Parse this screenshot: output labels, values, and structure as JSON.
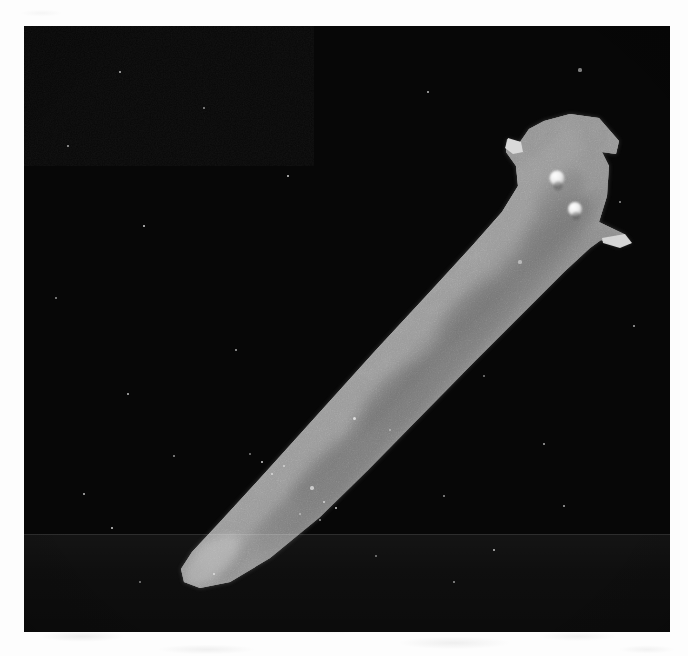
{
  "document": {
    "type": "photomicrograph",
    "medium": "black-and-white halftone print scan",
    "caption_visible": false
  },
  "plate": {
    "label": "planarian-photomicrograph",
    "background_color": "#070707",
    "margin_color": "#fdfdfd",
    "frame": {
      "x": 24,
      "y": 26,
      "width": 646,
      "height": 606
    }
  },
  "specimen": {
    "common_name": "planarian flatworm",
    "orientation": "head upper-right, tail lower-left",
    "body_color": "#9a9a9a",
    "gut_stripe_color": "#3a3a3a",
    "highlight_color": "#cfcfcf",
    "features": [
      {
        "name": "head",
        "label": "truncated triangular head"
      },
      {
        "name": "auricle-left",
        "label": "left auricle"
      },
      {
        "name": "auricle-right",
        "label": "right auricle"
      },
      {
        "name": "eyespot-anterior",
        "label": "anterior eyespot"
      },
      {
        "name": "eyespot-posterior",
        "label": "posterior eyespot"
      },
      {
        "name": "gut-stripe",
        "label": "dark median gut / pharynx stripe"
      },
      {
        "name": "tail",
        "label": "tapered pointed tail"
      }
    ]
  },
  "artifacts": {
    "scan_band_label": "horizontal scanner banding",
    "grain_label": "film grain",
    "debris_label": "suspended debris specks"
  },
  "specks": [
    {
      "x": 556,
      "y": 44,
      "r": 1.6
    },
    {
      "x": 180,
      "y": 82,
      "r": 1.3
    },
    {
      "x": 44,
      "y": 120,
      "r": 1.2
    },
    {
      "x": 404,
      "y": 66,
      "r": 1.0
    },
    {
      "x": 120,
      "y": 200,
      "r": 1.1
    },
    {
      "x": 496,
      "y": 236,
      "r": 1.6
    },
    {
      "x": 32,
      "y": 272,
      "r": 1.2
    },
    {
      "x": 212,
      "y": 324,
      "r": 1.0
    },
    {
      "x": 104,
      "y": 368,
      "r": 1.3
    },
    {
      "x": 330,
      "y": 392,
      "r": 1.5
    },
    {
      "x": 366,
      "y": 404,
      "r": 1.1
    },
    {
      "x": 150,
      "y": 430,
      "r": 1.0
    },
    {
      "x": 288,
      "y": 462,
      "r": 1.7
    },
    {
      "x": 300,
      "y": 476,
      "r": 1.3
    },
    {
      "x": 312,
      "y": 482,
      "r": 1.2
    },
    {
      "x": 276,
      "y": 488,
      "r": 1.4
    },
    {
      "x": 296,
      "y": 494,
      "r": 1.1
    },
    {
      "x": 260,
      "y": 440,
      "r": 1.2
    },
    {
      "x": 248,
      "y": 448,
      "r": 1.4
    },
    {
      "x": 238,
      "y": 436,
      "r": 1.0
    },
    {
      "x": 226,
      "y": 428,
      "r": 1.2
    },
    {
      "x": 420,
      "y": 470,
      "r": 1.1
    },
    {
      "x": 520,
      "y": 418,
      "r": 1.3
    },
    {
      "x": 470,
      "y": 524,
      "r": 1.0
    },
    {
      "x": 190,
      "y": 548,
      "r": 1.2
    },
    {
      "x": 116,
      "y": 556,
      "r": 1.0
    },
    {
      "x": 596,
      "y": 176,
      "r": 1.1
    },
    {
      "x": 610,
      "y": 300,
      "r": 1.0
    },
    {
      "x": 60,
      "y": 468,
      "r": 1.1
    },
    {
      "x": 88,
      "y": 502,
      "r": 1.0
    },
    {
      "x": 352,
      "y": 530,
      "r": 1.2
    },
    {
      "x": 430,
      "y": 556,
      "r": 1.0
    },
    {
      "x": 540,
      "y": 480,
      "r": 1.1
    },
    {
      "x": 96,
      "y": 46,
      "r": 1.0
    },
    {
      "x": 264,
      "y": 150,
      "r": 1.0
    },
    {
      "x": 460,
      "y": 350,
      "r": 1.0
    }
  ]
}
